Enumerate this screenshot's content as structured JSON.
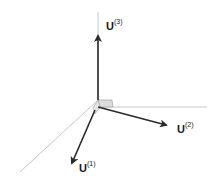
{
  "diagram": {
    "type": "3d-orthogonal-basis-vectors",
    "colors": {
      "background": "#ffffff",
      "axis_lines": "#c8c8c8",
      "vectors": "#2a2a2a",
      "corner_fill": "#dcdcdc"
    },
    "vectors": [
      {
        "id": "u1",
        "base": "U",
        "superscript": "(1)",
        "direction": "down-left"
      },
      {
        "id": "u2",
        "base": "U",
        "superscript": "(2)",
        "direction": "right-down"
      },
      {
        "id": "u3",
        "base": "U",
        "superscript": "(3)",
        "direction": "up"
      }
    ]
  }
}
